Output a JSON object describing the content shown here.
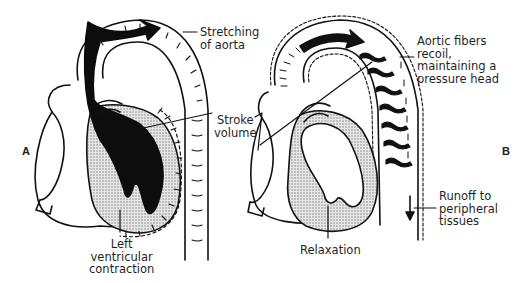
{
  "figure": {
    "panel_a": {
      "letter": "A",
      "labels": {
        "stretching": [
          "Stretching",
          "of aorta"
        ],
        "stroke_volume": [
          "Stroke",
          "volume"
        ],
        "lv_contraction": [
          "Left",
          "ventricular",
          "contraction"
        ]
      }
    },
    "panel_b": {
      "letter": "B",
      "labels": {
        "recoil": [
          "Aortic fibers",
          "recoil,",
          "maintaining a",
          "pressure head"
        ],
        "relaxation": [
          "Relaxation"
        ],
        "runoff": [
          "Runoff to",
          "peripheral",
          "tissues"
        ]
      }
    },
    "colors": {
      "ink": "#111111",
      "blood": "#0d0d0d",
      "stipple": "#bdbdbd",
      "background": "#ffffff"
    }
  }
}
